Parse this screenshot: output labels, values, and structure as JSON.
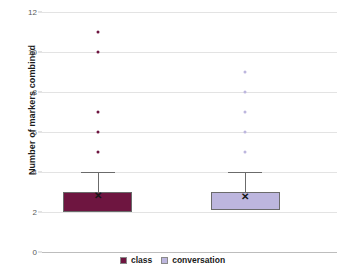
{
  "chart_data": {
    "type": "box",
    "title": "",
    "xlabel": "",
    "ylabel": "Number of markers combined",
    "ylim": [
      0,
      12
    ],
    "ytick_labels": [
      "0",
      "2",
      "4",
      "6",
      "8",
      "10",
      "12"
    ],
    "yticks": [
      0,
      2,
      4,
      6,
      8,
      10,
      12
    ],
    "grid": true,
    "legend_position": "bottom-center",
    "categories": [
      "class",
      "conversation"
    ],
    "series": [
      {
        "name": "class",
        "color": "#6E1540",
        "q1": 2,
        "median": 3,
        "q3": 3,
        "whisker_low": 2,
        "whisker_high": 4,
        "mean": 2.8,
        "outliers": [
          5,
          6,
          7,
          10,
          11
        ]
      },
      {
        "name": "conversation",
        "color": "#BDB6DE",
        "q1": 2.1,
        "median": 3,
        "q3": 3,
        "whisker_low": 2.1,
        "whisker_high": 4,
        "mean": 2.75,
        "outliers": [
          5,
          6,
          7,
          8,
          9
        ]
      }
    ]
  },
  "axis": {
    "y_title": "Number of markers combined"
  },
  "legend": {
    "items": [
      {
        "label": "class",
        "color": "#6E1540"
      },
      {
        "label": "conversation",
        "color": "#BDB6DE"
      }
    ]
  },
  "colors": {
    "class_fill": "#6E1540",
    "conversation_fill": "#BDB6DE",
    "gridline": "#e3e3e3",
    "axis_line": "#bdbdbd",
    "tick_text": "#5a5a5a",
    "title_text": "#1b1b1b",
    "box_border": "#6b6b6b",
    "mean_marker": "#161616"
  },
  "mean_marker_glyph": "✕"
}
